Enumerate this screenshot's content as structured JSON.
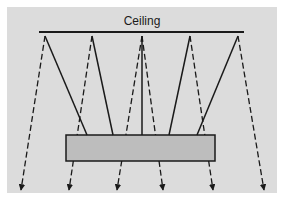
{
  "diagram": {
    "title": "Ceiling",
    "colors": {
      "background": "#dcdcdc",
      "panel_outer": "#ffffff",
      "line": "#1a1a1a",
      "fixture_fill": "#bdbdbd"
    },
    "ceiling_line": {
      "x1": 39,
      "y1": 32,
      "x2": 244,
      "y2": 32
    },
    "fixture": {
      "x": 66,
      "y": 135,
      "width": 149,
      "height": 26
    },
    "solid_rays": [
      {
        "from": [
          87,
          135
        ],
        "to": [
          45,
          36
        ]
      },
      {
        "from": [
          113,
          135
        ],
        "to": [
          92,
          36
        ]
      },
      {
        "from": [
          142,
          135
        ],
        "to": [
          142,
          36
        ]
      },
      {
        "from": [
          169,
          135
        ],
        "to": [
          190,
          36
        ]
      },
      {
        "from": [
          197,
          135
        ],
        "to": [
          238,
          36
        ]
      }
    ],
    "dashed_rays": [
      {
        "from": [
          45,
          36
        ],
        "to": [
          21,
          190
        ]
      },
      {
        "from": [
          92,
          36
        ],
        "to": [
          69,
          190
        ]
      },
      {
        "from": [
          142,
          36
        ],
        "to": [
          117,
          190
        ]
      },
      {
        "from": [
          142,
          36
        ],
        "to": [
          163,
          190
        ]
      },
      {
        "from": [
          190,
          36
        ],
        "to": [
          213,
          190
        ]
      },
      {
        "from": [
          238,
          36
        ],
        "to": [
          264,
          190
        ]
      }
    ]
  }
}
